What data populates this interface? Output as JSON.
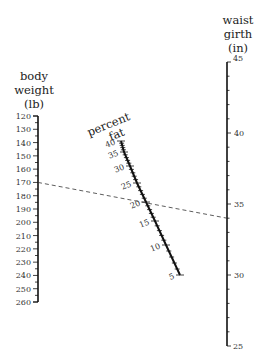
{
  "diagram": {
    "type": "nomogram",
    "scales": {
      "body_weight": {
        "title_lines": [
          "body",
          "weight",
          "(lb)"
        ],
        "ticks": [
          120,
          130,
          140,
          150,
          160,
          170,
          180,
          190,
          200,
          210,
          220,
          230,
          240,
          250,
          260
        ]
      },
      "percent_fat": {
        "title_lines": [
          "percent",
          "fat"
        ],
        "ticks": [
          40,
          35,
          30,
          25,
          20,
          15,
          10,
          5
        ]
      },
      "waist_girth": {
        "title_lines": [
          "waist",
          "girth",
          "(in)"
        ],
        "ticks": [
          45,
          40,
          35,
          30,
          25
        ]
      }
    },
    "example_line": {
      "body_weight": 170,
      "percent_fat": 19,
      "waist_girth": 34,
      "style": "dashed"
    }
  }
}
